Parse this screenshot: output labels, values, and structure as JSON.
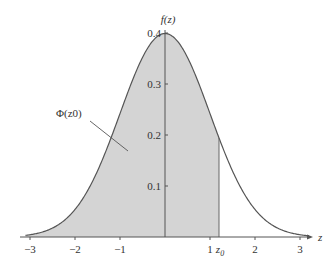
{
  "chart_data": {
    "type": "area",
    "title": "",
    "xlabel": "z",
    "ylabel": "f(z)",
    "xlim": [
      -3.1,
      3.2
    ],
    "ylim": [
      0,
      0.42
    ],
    "x_ticks": [
      -3,
      -2,
      -1,
      1,
      2,
      3
    ],
    "x_tick_labels": [
      "−3",
      "−2",
      "−1",
      "1",
      "2",
      "3"
    ],
    "y_ticks": [
      0.1,
      0.2,
      0.3,
      0.4
    ],
    "y_tick_labels": [
      "0.1",
      "0.2",
      "0.3",
      "0.4"
    ],
    "z0": 1.2,
    "z0_label": "z0",
    "shaded_region": {
      "from": -3.1,
      "to": 1.2,
      "label": "Φ(z0)"
    },
    "series": [
      {
        "name": "f(z)",
        "x": [
          -3,
          -2.5,
          -2,
          -1.5,
          -1,
          -0.5,
          0,
          0.5,
          1,
          1.5,
          2,
          2.5,
          3
        ],
        "values": [
          0.0044,
          0.0175,
          0.054,
          0.1295,
          0.242,
          0.3521,
          0.3989,
          0.3521,
          0.242,
          0.1295,
          0.054,
          0.0175,
          0.0044
        ]
      }
    ],
    "grid": false,
    "legend": "none"
  },
  "labels": {
    "y_axis": "f(z)",
    "x_axis": "z",
    "area_label": "Φ(z0)",
    "z0": "z",
    "z0_sub": "0"
  }
}
